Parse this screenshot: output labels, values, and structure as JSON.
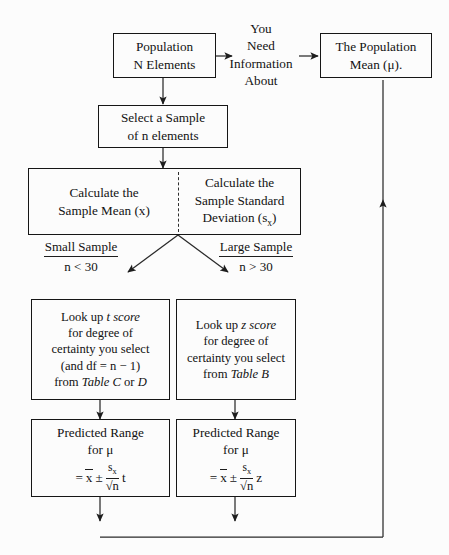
{
  "diagram": {
    "title_semantic": "confidence-interval-estimation-flowchart",
    "nodes": {
      "population": {
        "line1": "Population",
        "line2": "N Elements"
      },
      "need_info": {
        "line1": "You",
        "line2": "Need",
        "line3": "Information",
        "line4": "About"
      },
      "population_mean": {
        "line1": "The Population",
        "line2": "Mean  (μ)."
      },
      "select_sample": {
        "line1": "Select a Sample",
        "line2": "of n elements"
      },
      "calc_mean": {
        "line1": "Calculate the",
        "line2": "Sample Mean (x)"
      },
      "calc_sd": {
        "line1": "Calculate the",
        "line2": "Sample Standard",
        "line3": "Deviation (s",
        "line3_sub": "x",
        "line3_end": ")"
      },
      "small_sample": {
        "label": "Small Sample",
        "condition": "n < 30"
      },
      "large_sample": {
        "label": "Large Sample",
        "condition": "n > 30"
      },
      "lookup_t": {
        "line1_a": "Look up ",
        "line1_italic": "t score",
        "line2": "for degree of",
        "line3": "certainty you select",
        "line4": "(and df = n − 1)",
        "line5_a": "from ",
        "line5_italic": "Table C",
        "line5_b": " or ",
        "line5_italic2": "D"
      },
      "lookup_z": {
        "line1_a": "Look up ",
        "line1_italic": "z score",
        "line2": "for degree of",
        "line3": "certainty you select",
        "line4_a": "from ",
        "line4_italic": "Table  B"
      },
      "predicted_t": {
        "line1": "Predicted Range",
        "line2_a": "for ",
        "line2_mu": "μ",
        "eq": "=",
        "xbar": "x",
        "pm": "±",
        "num": "s",
        "num_sub": "x",
        "den": "√n",
        "stat": "t"
      },
      "predicted_z": {
        "line1": "Predicted Range",
        "line2_a": "for ",
        "line2_mu": "μ",
        "eq": "=",
        "xbar": "x",
        "pm": "±",
        "num": "s",
        "num_sub": "x",
        "den": "√n",
        "stat": "z"
      }
    },
    "colors": {
      "background": "#fcfcfc",
      "stroke": "#1d1d1d",
      "text": "#121212"
    }
  }
}
